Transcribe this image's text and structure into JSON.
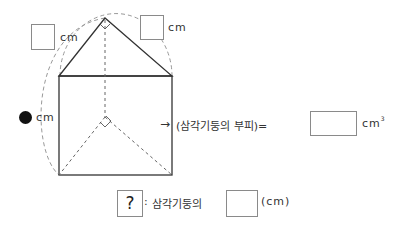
{
  "figure": {
    "name": "triangular-prism",
    "top_left_unit": "cm",
    "top_right_unit": "cm",
    "height_unit": "cm"
  },
  "formula": {
    "arrow": "→",
    "text": "(삼각기둥의 부피)=",
    "unit": "cm",
    "unit_exp": "3"
  },
  "legend": {
    "symbol": "?",
    "colon": ":",
    "text": "삼각기둥의",
    "unit": "(cm)"
  }
}
